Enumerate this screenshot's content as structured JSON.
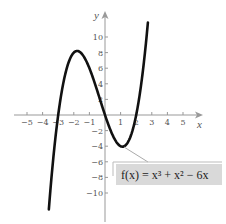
{
  "chart_data": {
    "type": "line",
    "title": "",
    "xlabel": "x",
    "ylabel": "y",
    "xlim": [
      -5.6,
      5.8
    ],
    "ylim": [
      -12.5,
      12
    ],
    "grid": false,
    "x_ticks": [
      -5,
      -4,
      -3,
      -2,
      -1,
      1,
      2,
      3,
      4,
      5
    ],
    "y_ticks": [
      -10,
      -8,
      -6,
      -4,
      -2,
      2,
      4,
      6,
      8,
      10
    ],
    "series": [
      {
        "name": "f(x) = x^3 + x^2 - 6x",
        "expression": "x^3 + x^2 - 6x",
        "x_range": [
          -3.6,
          2.75
        ],
        "points": [
          {
            "x": -3.6,
            "y": -12.1
          },
          {
            "x": -3.0,
            "y": 0
          },
          {
            "x": -1.79,
            "y": 8.21
          },
          {
            "x": 0,
            "y": 0
          },
          {
            "x": 1.12,
            "y": -4.06
          },
          {
            "x": 2.0,
            "y": 0
          },
          {
            "x": 2.75,
            "y": 11.9
          }
        ]
      }
    ],
    "annotations": [
      {
        "text": "f(x) = x³ + x² − 6x",
        "points_to": {
          "x": 1.12,
          "y": -4.06
        }
      }
    ]
  },
  "labels": {
    "x_axis": "x",
    "y_axis": "y",
    "function": "f(x) = x³ + x² − 6x",
    "x_tick_labels": [
      "−5",
      "−4",
      "−3",
      "−2",
      "−1",
      "1",
      "2",
      "3",
      "4",
      "5"
    ],
    "y_tick_labels": [
      "−10",
      "−8",
      "−6",
      "−4",
      "−2",
      "2",
      "4",
      "6",
      "8",
      "10"
    ]
  },
  "colors": {
    "curve": "#111111",
    "axis": "#999999",
    "label_box": "#d9d9d9"
  }
}
